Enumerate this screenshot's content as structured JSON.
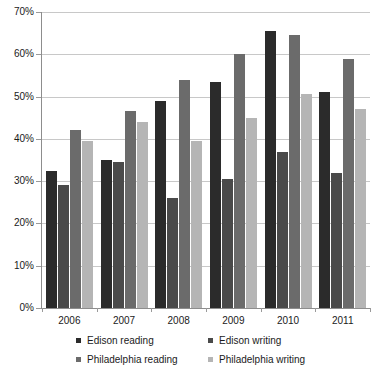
{
  "chart_data": {
    "type": "bar",
    "title": "",
    "subtitle": "",
    "xlabel": "",
    "ylabel": "",
    "categories": [
      "2006",
      "2007",
      "2008",
      "2009",
      "2010",
      "2011"
    ],
    "ylim": [
      0,
      70
    ],
    "ytick_step": 10,
    "ytick_labels": [
      "0%",
      "10%",
      "20%",
      "30%",
      "40%",
      "50%",
      "60%",
      "70%"
    ],
    "ytick_values": [
      0,
      10,
      20,
      30,
      40,
      50,
      60,
      70
    ],
    "grid": true,
    "legend_position": "bottom",
    "value_suffix": "%",
    "series": [
      {
        "name": "Edison reading",
        "color": "#2b2b2b",
        "values": [
          32.5,
          35,
          49,
          53.5,
          65.5,
          51
        ]
      },
      {
        "name": "Edison writing",
        "color": "#4a4a4a",
        "values": [
          29,
          34.5,
          26,
          30.5,
          37,
          32
        ]
      },
      {
        "name": "Philadelphia reading",
        "color": "#6b6b6b",
        "values": [
          42,
          46.5,
          54,
          60,
          64.5,
          59
        ]
      },
      {
        "name": "Philadelphia writing",
        "color": "#b5b5b5",
        "values": [
          39.5,
          44,
          39.5,
          45,
          50.5,
          47
        ]
      }
    ]
  },
  "axis": {
    "gridline_color": "#c8c8c8",
    "axis_line_color": "#8d8d8d"
  }
}
